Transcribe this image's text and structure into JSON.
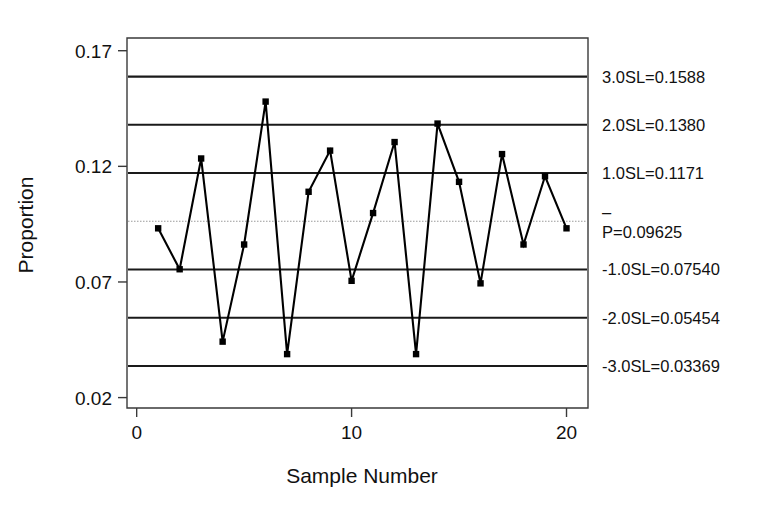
{
  "chart_data": {
    "type": "line",
    "title": "",
    "subtitle": "",
    "xlabel": "Sample Number",
    "ylabel": "Proportion",
    "x": [
      1,
      2,
      3,
      4,
      5,
      6,
      7,
      8,
      9,
      10,
      11,
      12,
      13,
      14,
      15,
      16,
      17,
      18,
      19,
      20
    ],
    "values": [
      0.0932,
      0.0755,
      0.1234,
      0.0442,
      0.0862,
      0.148,
      0.0388,
      0.109,
      0.1268,
      0.0705,
      0.0998,
      0.1305,
      0.0388,
      0.1385,
      0.1133,
      0.0694,
      0.1253,
      0.0862,
      0.1157,
      0.0932
    ],
    "series": [
      {
        "name": "Proportion",
        "values": [
          0.0932,
          0.0755,
          0.1234,
          0.0442,
          0.0862,
          0.148,
          0.0388,
          0.109,
          0.1268,
          0.0705,
          0.0998,
          0.1305,
          0.0388,
          0.1385,
          0.1133,
          0.0694,
          0.1253,
          0.0862,
          0.1157,
          0.0932
        ]
      }
    ],
    "xlim": [
      -0.45,
      21.0
    ],
    "ylim": [
      0.0155,
      0.1755
    ],
    "xticks": [
      0,
      10,
      20
    ],
    "xticklabels": [
      "0",
      "10",
      "20"
    ],
    "yticks": [
      0.02,
      0.07,
      0.12,
      0.17
    ],
    "yticklabels": [
      "0.02",
      "0.07",
      "0.12",
      "0.17"
    ],
    "grid": false,
    "legend": "none",
    "marker": "square",
    "control_limits": [
      {
        "id": "sl_plus_3",
        "value": 0.1588,
        "label": "3.0SL=0.1588",
        "style": "solid",
        "color": "#1a1a1a"
      },
      {
        "id": "sl_plus_2",
        "value": 0.138,
        "label": "2.0SL=0.1380",
        "style": "solid",
        "color": "#1a1a1a"
      },
      {
        "id": "sl_plus_1",
        "value": 0.1171,
        "label": "1.0SL=0.1171",
        "style": "solid",
        "color": "#1a1a1a"
      },
      {
        "id": "center",
        "value": 0.09625,
        "label": "P=0.09625",
        "overbar": "–",
        "style": "center",
        "color": "#9a9a9a"
      },
      {
        "id": "sl_minus_1",
        "value": 0.0754,
        "label": "-1.0SL=0.07540",
        "style": "solid",
        "color": "#1a1a1a"
      },
      {
        "id": "sl_minus_2",
        "value": 0.05454,
        "label": "-2.0SL=0.05454",
        "style": "solid",
        "color": "#1a1a1a"
      },
      {
        "id": "sl_minus_3",
        "value": 0.03369,
        "label": "-3.0SL=0.03369",
        "style": "solid",
        "color": "#1a1a1a"
      }
    ]
  }
}
